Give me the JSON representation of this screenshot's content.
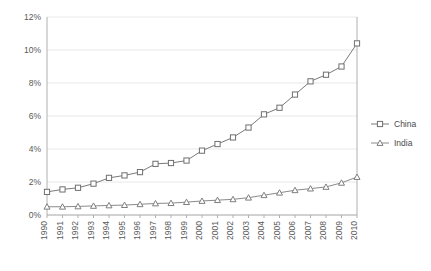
{
  "chart_data": {
    "type": "line",
    "title": "",
    "subtitle": "",
    "xlabel": "",
    "ylabel": "",
    "grid": true,
    "legend_position": "right",
    "ylim": [
      0,
      12
    ],
    "ytick_labels": [
      "0%",
      "2%",
      "4%",
      "6%",
      "8%",
      "10%",
      "12%"
    ],
    "ytick_values": [
      0,
      2,
      4,
      6,
      8,
      10,
      12
    ],
    "categories": [
      "1990",
      "1991",
      "1992",
      "1993",
      "1994",
      "1995",
      "1996",
      "1997",
      "1998",
      "1999",
      "2000",
      "2001",
      "2002",
      "2003",
      "2004",
      "2005",
      "2006",
      "2007",
      "2008",
      "2009",
      "2010"
    ],
    "series": [
      {
        "name": "China",
        "marker": "square",
        "color": "#6f6f6f",
        "values": [
          1.4,
          1.55,
          1.65,
          1.9,
          2.25,
          2.4,
          2.6,
          3.1,
          3.15,
          3.3,
          3.9,
          4.3,
          4.7,
          5.3,
          6.1,
          6.5,
          7.3,
          8.1,
          8.5,
          9.0,
          10.4
        ]
      },
      {
        "name": "India",
        "marker": "triangle",
        "color": "#7f7f7f",
        "values": [
          0.5,
          0.5,
          0.52,
          0.55,
          0.58,
          0.6,
          0.65,
          0.7,
          0.72,
          0.78,
          0.85,
          0.9,
          0.95,
          1.05,
          1.2,
          1.35,
          1.5,
          1.6,
          1.7,
          1.95,
          2.3
        ]
      }
    ]
  },
  "legend": {
    "items": [
      {
        "label": "China"
      },
      {
        "label": "India"
      }
    ]
  }
}
